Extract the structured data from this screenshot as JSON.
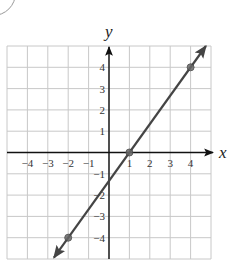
{
  "chart_data": {
    "type": "line",
    "title": "",
    "xlabel": "x",
    "ylabel": "y",
    "xlim": [
      -5,
      5
    ],
    "ylim": [
      -5,
      5
    ],
    "grid": true,
    "x_ticks": [
      -4,
      -3,
      -2,
      -1,
      1,
      2,
      3,
      4
    ],
    "y_ticks": [
      -4,
      -3,
      -2,
      -1,
      1,
      2,
      3,
      4
    ],
    "x_tick_labels": [
      "−4",
      "−3",
      "−2",
      "−1",
      "1",
      "2",
      "3",
      "4"
    ],
    "y_tick_labels": [
      "−4",
      "−3",
      "−2",
      "−1",
      "1",
      "2",
      "3",
      "4"
    ],
    "series": [
      {
        "name": "line",
        "equation": "y = (4/3)x - 4/3",
        "slope": 1.3333,
        "intercept": -1.3333,
        "points": [
          {
            "x": -2,
            "y": -4
          },
          {
            "x": 1,
            "y": 0
          },
          {
            "x": 4,
            "y": 4
          }
        ],
        "arrows_both_ends": true,
        "color": "#444444"
      }
    ]
  }
}
